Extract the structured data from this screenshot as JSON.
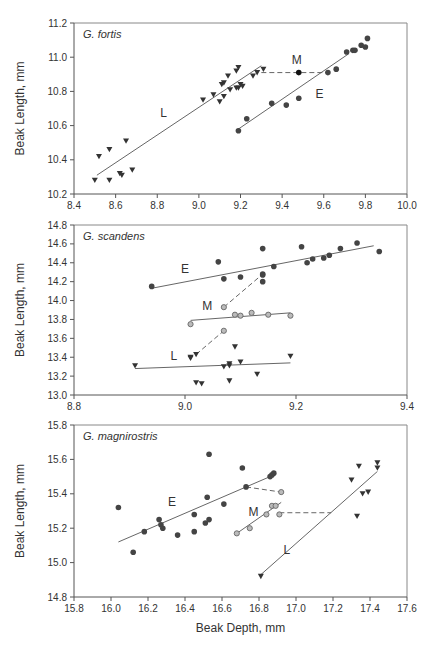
{
  "chart_data": [
    {
      "type": "scatter",
      "title": "G. fortis",
      "xlabel": "",
      "ylabel": "Beak Length, mm",
      "xlim": [
        8.4,
        10.0
      ],
      "ylim": [
        10.2,
        11.2
      ],
      "xticks": [
        "8.4",
        "8.6",
        "8.8",
        "9.0",
        "9.2",
        "9.4",
        "9.6",
        "9.8",
        "10.0"
      ],
      "yticks": [
        "10.2",
        "10.4",
        "10.6",
        "10.8",
        "11.0",
        "11.2"
      ],
      "box": {
        "left": 74,
        "right": 407,
        "top": 23,
        "bottom": 194
      },
      "series": [
        {
          "name": "L",
          "marker": "triangle-down",
          "color": "#333333",
          "points": [
            [
              8.5,
              10.28
            ],
            [
              8.52,
              10.42
            ],
            [
              8.57,
              10.28
            ],
            [
              8.57,
              10.46
            ],
            [
              8.62,
              10.32
            ],
            [
              8.63,
              10.31
            ],
            [
              8.65,
              10.51
            ],
            [
              8.68,
              10.34
            ],
            [
              9.02,
              10.75
            ],
            [
              9.07,
              10.78
            ],
            [
              9.1,
              10.74
            ],
            [
              9.11,
              10.84
            ],
            [
              9.12,
              10.85
            ],
            [
              9.12,
              10.77
            ],
            [
              9.14,
              10.89
            ],
            [
              9.15,
              10.81
            ],
            [
              9.18,
              10.82
            ],
            [
              9.18,
              10.92
            ],
            [
              9.19,
              10.94
            ],
            [
              9.19,
              10.82
            ],
            [
              9.2,
              10.84
            ],
            [
              9.21,
              10.83
            ],
            [
              9.26,
              10.89
            ],
            [
              9.28,
              10.91
            ],
            [
              9.31,
              10.93
            ]
          ],
          "fit": [
            [
              8.51,
              10.31
            ],
            [
              9.3,
              10.95
            ]
          ],
          "fit_style": "solid"
        },
        {
          "name": "E",
          "marker": "circle",
          "color": "#444444",
          "points": [
            [
              9.19,
              10.57
            ],
            [
              9.23,
              10.64
            ],
            [
              9.35,
              10.73
            ],
            [
              9.42,
              10.72
            ],
            [
              9.48,
              10.76
            ],
            [
              9.62,
              10.91
            ],
            [
              9.66,
              10.93
            ],
            [
              9.71,
              11.03
            ],
            [
              9.74,
              11.04
            ],
            [
              9.75,
              11.04
            ],
            [
              9.78,
              11.07
            ],
            [
              9.8,
              11.06
            ],
            [
              9.81,
              11.11
            ]
          ],
          "fit": [
            [
              9.19,
              10.58
            ],
            [
              9.72,
              11.02
            ]
          ],
          "fit_style": "solid"
        },
        {
          "name": "M",
          "marker": "circle",
          "color": "#111111",
          "points": [
            [
              9.48,
              10.91
            ]
          ],
          "fit": [
            [
              9.3,
              10.91
            ],
            [
              9.62,
              10.91
            ]
          ],
          "fit_style": "dashed"
        }
      ],
      "labels": [
        {
          "text": "L",
          "x": 8.83,
          "y": 10.65
        },
        {
          "text": "E",
          "x": 9.58,
          "y": 10.76
        },
        {
          "text": "M",
          "x": 9.47,
          "y": 10.96
        }
      ]
    },
    {
      "type": "scatter",
      "title": "G. scandens",
      "xlabel": "",
      "ylabel": "Beak Length, mm",
      "xlim": [
        8.8,
        9.4
      ],
      "ylim": [
        13.0,
        14.8
      ],
      "xticks": [
        "8.8",
        "9.0",
        "9.2",
        "9.4"
      ],
      "yticks": [
        "13.0",
        "13.2",
        "13.4",
        "13.6",
        "13.8",
        "14.0",
        "14.2",
        "14.4",
        "14.6",
        "14.8"
      ],
      "box": {
        "left": 74,
        "right": 407,
        "top": 225,
        "bottom": 395
      },
      "series": [
        {
          "name": "E",
          "marker": "circle",
          "color": "#444444",
          "points": [
            [
              8.94,
              14.15
            ],
            [
              9.06,
              14.41
            ],
            [
              9.07,
              14.23
            ],
            [
              9.1,
              14.25
            ],
            [
              9.14,
              14.55
            ],
            [
              9.14,
              14.28
            ],
            [
              9.14,
              14.27
            ],
            [
              9.14,
              14.2
            ],
            [
              9.16,
              14.36
            ],
            [
              9.21,
              14.57
            ],
            [
              9.22,
              14.4
            ],
            [
              9.23,
              14.44
            ],
            [
              9.25,
              14.45
            ],
            [
              9.26,
              14.48
            ],
            [
              9.28,
              14.55
            ],
            [
              9.31,
              14.61
            ],
            [
              9.35,
              14.52
            ]
          ],
          "fit": [
            [
              8.94,
              14.13
            ],
            [
              9.34,
              14.58
            ]
          ],
          "fit_style": "solid"
        },
        {
          "name": "M",
          "marker": "open-circle",
          "color": "#999999",
          "points": [
            [
              9.01,
              13.75
            ],
            [
              9.07,
              13.93
            ],
            [
              9.07,
              13.68
            ],
            [
              9.09,
              13.85
            ],
            [
              9.1,
              13.84
            ],
            [
              9.12,
              13.87
            ],
            [
              9.15,
              13.85
            ],
            [
              9.19,
              13.84
            ]
          ],
          "fit": [
            [
              9.01,
              13.79
            ],
            [
              9.19,
              13.87
            ]
          ],
          "fit_style": "solid"
        },
        {
          "name": "L",
          "marker": "triangle-down",
          "color": "#333333",
          "points": [
            [
              8.91,
              13.31
            ],
            [
              9.01,
              13.39
            ],
            [
              9.01,
              13.4
            ],
            [
              9.02,
              13.43
            ],
            [
              9.02,
              13.13
            ],
            [
              9.03,
              13.12
            ],
            [
              9.07,
              13.3
            ],
            [
              9.08,
              13.33
            ],
            [
              9.08,
              13.31
            ],
            [
              9.08,
              13.15
            ],
            [
              9.09,
              13.51
            ],
            [
              9.1,
              13.35
            ],
            [
              9.13,
              13.22
            ],
            [
              9.19,
              13.41
            ]
          ],
          "fit": [
            [
              8.91,
              13.28
            ],
            [
              9.19,
              13.34
            ]
          ],
          "fit_style": "solid"
        },
        {
          "name": "E-M",
          "marker": "none",
          "color": "#666666",
          "points": [],
          "fit": [
            [
              9.07,
              13.93
            ],
            [
              9.14,
              14.28
            ]
          ],
          "fit_style": "dashed"
        },
        {
          "name": "M-L",
          "marker": "none",
          "color": "#666666",
          "points": [],
          "fit": [
            [
              9.02,
              13.43
            ],
            [
              9.07,
              13.68
            ]
          ],
          "fit_style": "dashed"
        }
      ],
      "labels": [
        {
          "text": "E",
          "x": 9.0,
          "y": 14.29
        },
        {
          "text": "M",
          "x": 9.04,
          "y": 13.9
        },
        {
          "text": "L",
          "x": 8.98,
          "y": 13.37
        }
      ]
    },
    {
      "type": "scatter",
      "title": "G. magnirostris",
      "xlabel": "Beak Depth, mm",
      "ylabel": "Beak Length, mm",
      "xlim": [
        15.8,
        17.6
      ],
      "ylim": [
        14.8,
        15.8
      ],
      "xticks": [
        "15.8",
        "16.0",
        "16.2",
        "16.4",
        "16.6",
        "16.8",
        "17.0",
        "17.2",
        "17.4",
        "17.6"
      ],
      "yticks": [
        "14.8",
        "15.0",
        "15.2",
        "15.4",
        "15.6",
        "15.8"
      ],
      "box": {
        "left": 74,
        "right": 407,
        "top": 425,
        "bottom": 597
      },
      "series": [
        {
          "name": "E",
          "marker": "circle",
          "color": "#444444",
          "points": [
            [
              16.04,
              15.32
            ],
            [
              16.12,
              15.06
            ],
            [
              16.18,
              15.18
            ],
            [
              16.26,
              15.25
            ],
            [
              16.27,
              15.22
            ],
            [
              16.28,
              15.2
            ],
            [
              16.36,
              15.16
            ],
            [
              16.45,
              15.28
            ],
            [
              16.45,
              15.18
            ],
            [
              16.51,
              15.23
            ],
            [
              16.52,
              15.38
            ],
            [
              16.53,
              15.25
            ],
            [
              16.53,
              15.63
            ],
            [
              16.61,
              15.34
            ],
            [
              16.71,
              15.55
            ],
            [
              16.73,
              15.44
            ],
            [
              16.86,
              15.5
            ],
            [
              16.87,
              15.51
            ],
            [
              16.88,
              15.52
            ]
          ],
          "fit": [
            [
              16.04,
              15.12
            ],
            [
              16.86,
              15.5
            ]
          ],
          "fit_style": "solid"
        },
        {
          "name": "M",
          "marker": "open-circle",
          "color": "#999999",
          "points": [
            [
              16.68,
              15.17
            ],
            [
              16.75,
              15.2
            ],
            [
              16.84,
              15.28
            ],
            [
              16.87,
              15.33
            ],
            [
              16.89,
              15.33
            ],
            [
              16.91,
              15.28
            ],
            [
              16.92,
              15.41
            ]
          ],
          "fit": [
            [
              16.68,
              15.17
            ],
            [
              16.92,
              15.35
            ]
          ],
          "fit_style": "solid"
        },
        {
          "name": "L",
          "marker": "triangle-down",
          "color": "#333333",
          "points": [
            [
              16.81,
              14.92
            ],
            [
              17.3,
              15.48
            ],
            [
              17.33,
              15.27
            ],
            [
              17.34,
              15.56
            ],
            [
              17.36,
              15.4
            ],
            [
              17.39,
              15.41
            ],
            [
              17.44,
              15.58
            ],
            [
              17.44,
              15.55
            ]
          ],
          "fit": [
            [
              16.81,
              14.93
            ],
            [
              17.44,
              15.53
            ]
          ],
          "fit_style": "solid"
        },
        {
          "name": "E-M",
          "marker": "none",
          "color": "#666666",
          "points": [],
          "fit": [
            [
              16.73,
              15.44
            ],
            [
              16.92,
              15.41
            ]
          ],
          "fit_style": "dashed"
        },
        {
          "name": "M-L",
          "marker": "none",
          "color": "#666666",
          "points": [],
          "fit": [
            [
              16.91,
              15.29
            ],
            [
              17.19,
              15.29
            ]
          ],
          "fit_style": "dashed"
        }
      ],
      "labels": [
        {
          "text": "E",
          "x": 16.33,
          "y": 15.33
        },
        {
          "text": "M",
          "x": 16.77,
          "y": 15.27
        },
        {
          "text": "L",
          "x": 16.95,
          "y": 15.05
        }
      ]
    }
  ]
}
